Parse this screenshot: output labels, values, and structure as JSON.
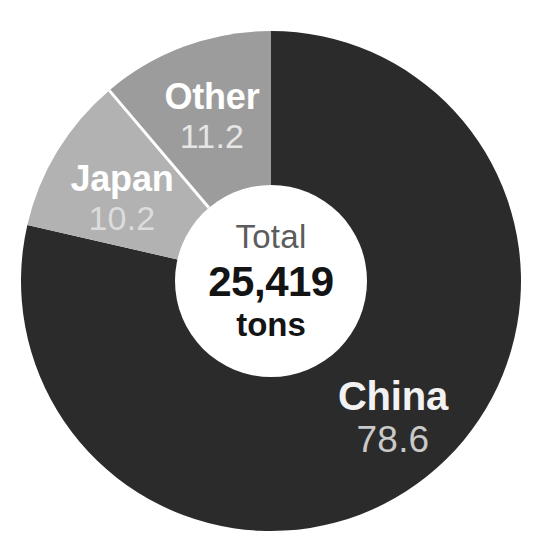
{
  "chart_data": {
    "type": "pie",
    "variant": "donut",
    "title": "",
    "subtitle": "",
    "xlabel": "",
    "ylabel": "",
    "unit": "%",
    "grid": false,
    "legend_position": "none",
    "labels_inline": true,
    "start_angle_deg": 0,
    "direction": "clockwise",
    "categories": [
      "China",
      "Japan",
      "Other"
    ],
    "values": [
      78.6,
      10.2,
      11.2
    ],
    "value_labels": [
      "78.6",
      "10.2",
      "11.2"
    ],
    "colors": [
      "#2b2b2b",
      "#b2b2b2",
      "#9c9c9c"
    ],
    "slices": [
      {
        "name": "China",
        "value": 78.6,
        "value_label": "78.6",
        "color": "#2b2b2b",
        "label_color": "#f2f2f2",
        "value_color": "#c9c9c9"
      },
      {
        "name": "Japan",
        "value": 10.2,
        "value_label": "10.2",
        "color": "#b2b2b2",
        "label_color": "#ffffff",
        "value_color": "#dcdcdc"
      },
      {
        "name": "Other",
        "value": 11.2,
        "value_label": "11.2",
        "color": "#9c9c9c",
        "label_color": "#ffffff",
        "value_color": "#e6e6e6"
      }
    ],
    "center": {
      "label": "Total",
      "value": "25,419",
      "unit": "tons",
      "label_color": "#5c5c5c",
      "value_color": "#141414",
      "hub_color": "#ffffff"
    },
    "geometry": {
      "center_x": 271,
      "center_y": 281,
      "outer_radius": 250,
      "inner_radius": 96,
      "divider_color": "#ffffff"
    },
    "background": "#ffffff"
  }
}
